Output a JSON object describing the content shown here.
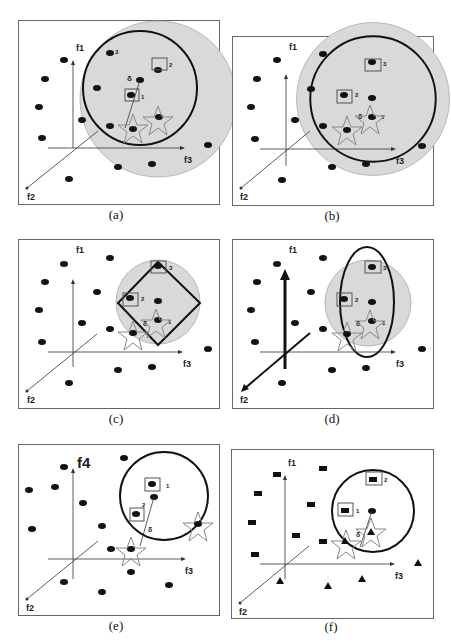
{
  "figure": {
    "panels": [
      {
        "id": "a",
        "caption": "(a)",
        "axis_labels": {
          "f1": "f1",
          "f2": "f2",
          "f3": "f3"
        },
        "labels": {
          "n1": "1",
          "n2": "2",
          "n3": "3",
          "delta": "δ"
        },
        "shape": "circle"
      },
      {
        "id": "b",
        "caption": "(b)",
        "axis_labels": {
          "f1": "f1",
          "f2": "f2",
          "f3": "f3"
        },
        "labels": {
          "n1": "1",
          "n2": "2",
          "n3": "3",
          "delta": "δ"
        },
        "shape": "circle-concentric"
      },
      {
        "id": "c",
        "caption": "(c)",
        "axis_labels": {
          "f1": "f1",
          "f2": "f2",
          "f3": "f3"
        },
        "labels": {
          "n1": "1",
          "n2": "2",
          "n3": "3",
          "delta": "δ"
        },
        "shape": "diamond"
      },
      {
        "id": "d",
        "caption": "(d)",
        "axis_labels": {
          "f1": "f1",
          "f2": "f2",
          "f3": "f3"
        },
        "labels": {
          "n1": "1",
          "n2": "2",
          "n3": "3",
          "delta": "δ"
        },
        "shape": "ellipse"
      },
      {
        "id": "e",
        "caption": "(e)",
        "axis_labels": {
          "f4": "f4",
          "f2": "f2",
          "f3": "f3"
        },
        "labels": {
          "n1": "1",
          "n2": "2",
          "delta": "δ"
        },
        "shape": "circle"
      },
      {
        "id": "f",
        "caption": "(f)",
        "axis_labels": {
          "f1": "f1",
          "f2": "f2",
          "f3": "f3"
        },
        "labels": {
          "n1": "1",
          "n2": "2",
          "delta": "δ"
        },
        "shape": "circle"
      }
    ],
    "colors": {
      "point": "#111111",
      "region_fill": "#d9d9d9",
      "border": "#555555",
      "star": "#888888"
    }
  }
}
